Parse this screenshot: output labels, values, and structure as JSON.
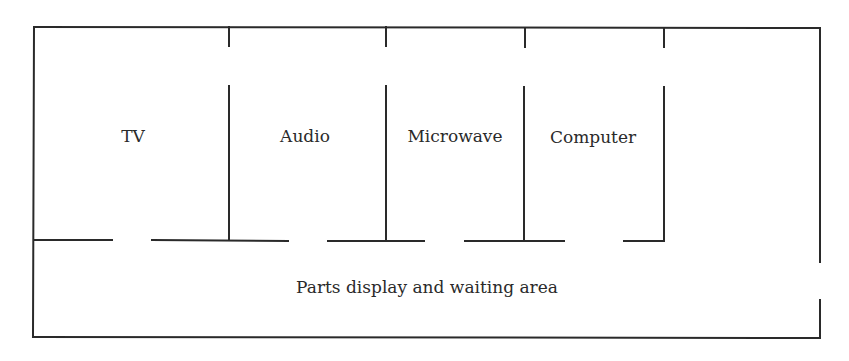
{
  "diagram": {
    "type": "floor-plan",
    "line_color": "#2a2a2a",
    "rooms": [
      {
        "id": "tv",
        "label": "TV"
      },
      {
        "id": "audio",
        "label": "Audio"
      },
      {
        "id": "microwave",
        "label": "Microwave"
      },
      {
        "id": "computer",
        "label": "Computer"
      },
      {
        "id": "storage",
        "label": ""
      }
    ],
    "common_area": {
      "label": "Parts display and waiting area"
    },
    "doorways": [
      {
        "between": "tv",
        "and": "common_area"
      },
      {
        "between": "audio",
        "and": "common_area"
      },
      {
        "between": "microwave",
        "and": "common_area"
      },
      {
        "between": "computer",
        "and": "common_area"
      },
      {
        "between": "common_area",
        "and": "exterior",
        "side": "right"
      }
    ]
  }
}
